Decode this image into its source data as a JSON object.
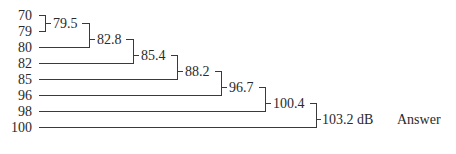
{
  "inputs": [
    {
      "label": "70",
      "y": 15
    },
    {
      "label": "79",
      "y": 31
    },
    {
      "label": "80",
      "y": 47
    },
    {
      "label": "82",
      "y": 63
    },
    {
      "label": "85",
      "y": 79
    },
    {
      "label": "96",
      "y": 95
    },
    {
      "label": "98",
      "y": 111
    },
    {
      "label": "100",
      "y": 127
    }
  ],
  "sums": [
    {
      "label": "79.5",
      "x": 55,
      "y": 23
    },
    {
      "label": "82.8",
      "x": 95,
      "y": 39
    },
    {
      "label": "85.4",
      "x": 140,
      "y": 55
    },
    {
      "label": "88.2",
      "x": 183,
      "y": 71
    },
    {
      "label": "96.7",
      "x": 228,
      "y": 87
    },
    {
      "label": "100.4",
      "x": 272,
      "y": 103
    },
    {
      "label": "103.2 dB",
      "x": 316,
      "y": 119
    }
  ],
  "answer_label": "Answer"
}
